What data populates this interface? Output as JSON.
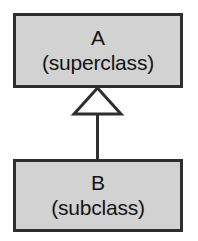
{
  "diagram": {
    "type": "uml-class-diagram",
    "background_color": "#ffffff",
    "box_fill_color": "#d2d2d2",
    "box_border_color": "#2e2e2e",
    "connector_color": "#2e2e2e",
    "arrowhead_fill_color": "#ffffff",
    "classes": [
      {
        "id": "a",
        "name": "A",
        "stereotype": "(superclass)"
      },
      {
        "id": "b",
        "name": "B",
        "stereotype": "(subclass)"
      }
    ],
    "relationship": {
      "kind": "generalization",
      "from": "B",
      "to": "A",
      "arrowhead": "hollow-triangle"
    }
  }
}
